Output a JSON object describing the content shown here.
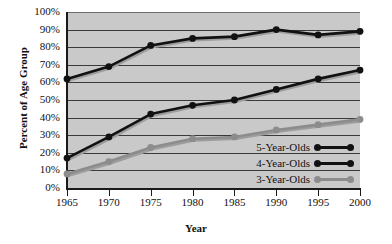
{
  "chart_data": {
    "type": "line",
    "title": "",
    "xlabel": "Year",
    "ylabel": "Percent of Age Group",
    "categories": [
      "1965",
      "1970",
      "1975",
      "1980",
      "1985",
      "1990",
      "1995",
      "2000"
    ],
    "x": [
      1965,
      1970,
      1975,
      1980,
      1985,
      1990,
      1995,
      2000
    ],
    "xlim": [
      1965,
      2000
    ],
    "ylim": [
      0,
      100
    ],
    "y_tick_labels": [
      "100%",
      "90%",
      "80%",
      "70%",
      "60%",
      "50%",
      "40%",
      "30%",
      "20%",
      "10%",
      "0%"
    ],
    "y_ticks": [
      100,
      90,
      80,
      70,
      60,
      50,
      40,
      30,
      20,
      10,
      0
    ],
    "grid": "horizontal",
    "legend_position": "lower-right-inside",
    "plot_background": "#c9c9c9",
    "series": [
      {
        "name": "5-Year-Olds",
        "color": "#111111",
        "values": [
          62,
          69,
          81,
          85,
          86,
          90,
          87,
          89
        ]
      },
      {
        "name": "4-Year-Olds",
        "color": "#111111",
        "values": [
          17,
          29,
          42,
          47,
          50,
          56,
          62,
          67
        ]
      },
      {
        "name": "3-Year-Olds",
        "color": "#8c8c8c",
        "values": [
          8,
          15,
          23,
          28,
          29,
          33,
          36,
          39
        ]
      }
    ]
  },
  "legend": {
    "items": [
      {
        "label": "5-Year-Olds",
        "color": "#111111"
      },
      {
        "label": "4-Year-Olds",
        "color": "#111111"
      },
      {
        "label": "3-Year-Olds",
        "color": "#8c8c8c"
      }
    ]
  },
  "axes": {
    "x_title": "Year",
    "y_title": "Percent of Age Group"
  }
}
